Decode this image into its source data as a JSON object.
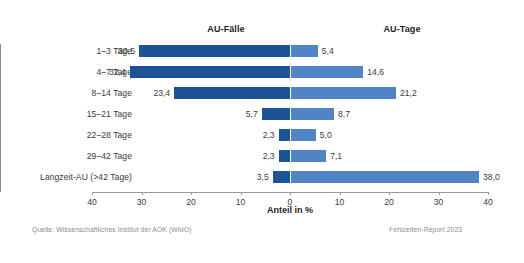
{
  "panels": {
    "left_title": "AU-Fälle",
    "right_title": "AU-Tage"
  },
  "axis": {
    "title": "Anteil in %",
    "tick_labels": [
      "40",
      "30",
      "20",
      "10",
      "0",
      "10",
      "20",
      "30",
      "40"
    ]
  },
  "footer": {
    "source": "Quelle: Wissenschaftliches Institut der AOK (WIdO)",
    "report": "Fehlzeiten-Report 2023"
  },
  "value_labels": {
    "faelle": [
      "30,5",
      "32,4",
      "23,4",
      "5,7",
      "2,3",
      "2,3",
      "3,5"
    ],
    "tage": [
      "5,4",
      "14,6",
      "21,2",
      "8,7",
      "5,0",
      "7,1",
      "38,0"
    ]
  },
  "chart_data": {
    "type": "bar",
    "title": "",
    "subtitle": "",
    "orientation": "horizontal",
    "layout": "back-to-back bidirectional bar chart (diverging from shared zero axis)",
    "categories": [
      "1–3 Tage",
      "4–7 Tage",
      "8–14 Tage",
      "15–21 Tage",
      "22–28 Tage",
      "29–42 Tage",
      "Langzeit-AU (>42 Tage)"
    ],
    "series": [
      {
        "name": "AU-Fälle",
        "direction": "left",
        "color": "#1c5296",
        "values": [
          30.5,
          32.4,
          23.4,
          5.7,
          2.3,
          2.3,
          3.5
        ]
      },
      {
        "name": "AU-Tage",
        "direction": "right",
        "color": "#5084c4",
        "values": [
          5.4,
          14.6,
          21.2,
          8.7,
          5.0,
          7.1,
          38.0
        ]
      }
    ],
    "xlabel": "Anteil in %",
    "ylabel": "",
    "xlim": [
      -40,
      40
    ],
    "xticks": [
      -40,
      -30,
      -20,
      -10,
      0,
      10,
      20,
      30,
      40
    ],
    "xtick_labels": [
      "40",
      "30",
      "20",
      "10",
      "0",
      "10",
      "20",
      "30",
      "40"
    ],
    "grid": false,
    "legend": "panel titles above each side"
  }
}
